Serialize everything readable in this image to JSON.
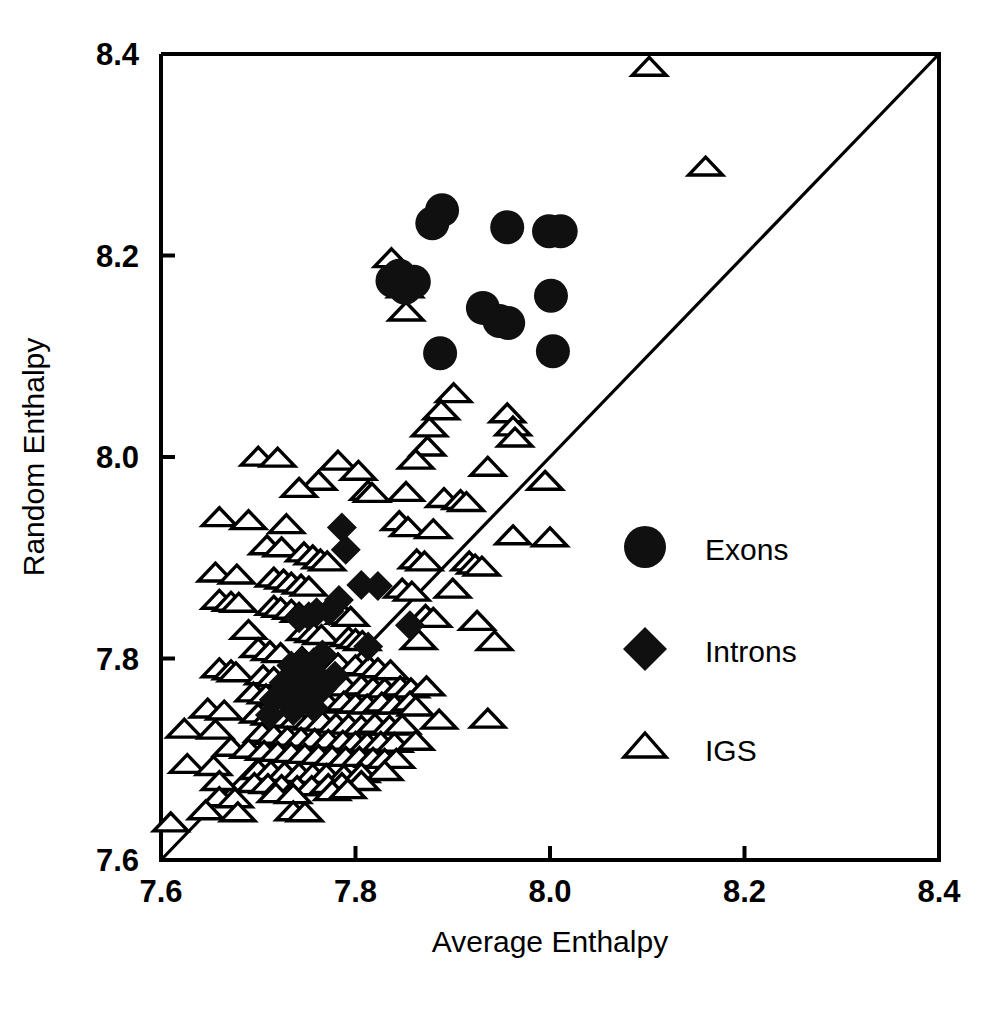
{
  "chart_data": {
    "type": "scatter",
    "title": "",
    "xlabel": "Average Enthalpy",
    "ylabel": "Random Enthalpy",
    "xlim": [
      7.6,
      8.4
    ],
    "ylim": [
      7.6,
      8.4
    ],
    "xticks": [
      "7.6",
      "7.8",
      "8.0",
      "8.2",
      "8.4"
    ],
    "yticks": [
      "7.6",
      "7.8",
      "8.0",
      "8.2",
      "8.4"
    ],
    "xtick_values": [
      7.6,
      7.8,
      8.0,
      8.2,
      8.4
    ],
    "ytick_values": [
      7.6,
      7.8,
      8.0,
      8.2,
      8.4
    ],
    "grid": false,
    "legend_position": "inside-lower-right",
    "reference_line": {
      "name": "identity-line",
      "description": "y = x diagonal",
      "from": [
        7.6,
        7.6
      ],
      "to": [
        8.4,
        8.4
      ]
    },
    "series": [
      {
        "name": "Exons",
        "marker": "filled-circle",
        "color": "#101010",
        "points": [
          [
            7.889,
            8.245
          ],
          [
            7.879,
            8.232
          ],
          [
            7.956,
            8.228
          ],
          [
            7.999,
            8.224
          ],
          [
            8.011,
            8.224
          ],
          [
            7.845,
            8.18
          ],
          [
            7.838,
            8.175
          ],
          [
            7.86,
            8.174
          ],
          [
            7.851,
            8.168
          ],
          [
            8.001,
            8.16
          ],
          [
            7.931,
            8.148
          ],
          [
            7.948,
            8.135
          ],
          [
            7.957,
            8.133
          ],
          [
            7.887,
            8.103
          ],
          [
            8.003,
            8.105
          ]
        ]
      },
      {
        "name": "Introns",
        "marker": "filled-diamond",
        "color": "#101010",
        "points": [
          [
            7.786,
            7.93
          ],
          [
            7.79,
            7.908
          ],
          [
            7.806,
            7.873
          ],
          [
            7.823,
            7.872
          ],
          [
            7.783,
            7.858
          ],
          [
            7.773,
            7.847
          ],
          [
            7.76,
            7.846
          ],
          [
            7.752,
            7.842
          ],
          [
            7.742,
            7.84
          ],
          [
            7.856,
            7.833
          ],
          [
            7.813,
            7.812
          ],
          [
            7.766,
            7.804
          ],
          [
            7.744,
            7.797
          ],
          [
            7.734,
            7.793
          ],
          [
            7.757,
            7.786
          ],
          [
            7.779,
            7.783
          ],
          [
            7.75,
            7.78
          ],
          [
            7.738,
            7.777
          ],
          [
            7.726,
            7.776
          ],
          [
            7.766,
            7.77
          ],
          [
            7.745,
            7.766
          ],
          [
            7.727,
            7.762
          ],
          [
            7.716,
            7.759
          ],
          [
            7.757,
            7.751
          ],
          [
            7.736,
            7.748
          ],
          [
            7.712,
            7.744
          ]
        ]
      },
      {
        "name": "IGS",
        "marker": "open-triangle",
        "color": "#ffffff",
        "points": [
          [
            8.102,
            8.387
          ],
          [
            8.16,
            8.288
          ],
          [
            7.837,
            8.197
          ],
          [
            7.851,
            8.167
          ],
          [
            7.852,
            8.144
          ],
          [
            7.901,
            8.063
          ],
          [
            7.888,
            8.046
          ],
          [
            7.956,
            8.043
          ],
          [
            7.962,
            8.03
          ],
          [
            7.876,
            8.029
          ],
          [
            7.964,
            8.019
          ],
          [
            7.874,
            8.01
          ],
          [
            7.7,
            8.0
          ],
          [
            7.72,
            7.999
          ],
          [
            7.782,
            7.996
          ],
          [
            7.862,
            7.997
          ],
          [
            7.936,
            7.99
          ],
          [
            7.803,
            7.986
          ],
          [
            7.995,
            7.976
          ],
          [
            7.762,
            7.976
          ],
          [
            7.742,
            7.969
          ],
          [
            7.813,
            7.966
          ],
          [
            7.817,
            7.964
          ],
          [
            7.852,
            7.965
          ],
          [
            7.891,
            7.959
          ],
          [
            7.908,
            7.957
          ],
          [
            7.914,
            7.955
          ],
          [
            7.66,
            7.94
          ],
          [
            7.69,
            7.937
          ],
          [
            7.845,
            7.936
          ],
          [
            7.729,
            7.933
          ],
          [
            7.854,
            7.93
          ],
          [
            7.88,
            7.928
          ],
          [
            7.962,
            7.922
          ],
          [
            8.0,
            7.92
          ],
          [
            7.709,
            7.912
          ],
          [
            7.724,
            7.91
          ],
          [
            7.747,
            7.905
          ],
          [
            7.756,
            7.902
          ],
          [
            7.764,
            7.898
          ],
          [
            7.771,
            7.896
          ],
          [
            7.863,
            7.898
          ],
          [
            7.871,
            7.896
          ],
          [
            7.917,
            7.896
          ],
          [
            7.923,
            7.893
          ],
          [
            7.93,
            7.891
          ],
          [
            7.656,
            7.885
          ],
          [
            7.678,
            7.883
          ],
          [
            7.716,
            7.88
          ],
          [
            7.726,
            7.878
          ],
          [
            7.734,
            7.875
          ],
          [
            7.744,
            7.873
          ],
          [
            7.752,
            7.871
          ],
          [
            7.848,
            7.869
          ],
          [
            7.858,
            7.866
          ],
          [
            7.9,
            7.869
          ],
          [
            7.66,
            7.858
          ],
          [
            7.672,
            7.856
          ],
          [
            7.68,
            7.855
          ],
          [
            7.716,
            7.852
          ],
          [
            7.723,
            7.85
          ],
          [
            7.734,
            7.848
          ],
          [
            7.742,
            7.845
          ],
          [
            7.788,
            7.843
          ],
          [
            7.795,
            7.841
          ],
          [
            7.872,
            7.843
          ],
          [
            7.88,
            7.84
          ],
          [
            7.925,
            7.837
          ],
          [
            7.69,
            7.828
          ],
          [
            7.748,
            7.827
          ],
          [
            7.757,
            7.825
          ],
          [
            7.765,
            7.823
          ],
          [
            7.793,
            7.821
          ],
          [
            7.8,
            7.819
          ],
          [
            7.807,
            7.817
          ],
          [
            7.865,
            7.818
          ],
          [
            7.943,
            7.817
          ],
          [
            7.7,
            7.81
          ],
          [
            7.712,
            7.807
          ],
          [
            7.723,
            7.805
          ],
          [
            7.745,
            7.801
          ],
          [
            7.757,
            7.799
          ],
          [
            7.771,
            7.797
          ],
          [
            7.782,
            7.795
          ],
          [
            7.8,
            7.793
          ],
          [
            7.814,
            7.792
          ],
          [
            7.823,
            7.79
          ],
          [
            7.836,
            7.788
          ],
          [
            7.66,
            7.79
          ],
          [
            7.672,
            7.788
          ],
          [
            7.677,
            7.786
          ],
          [
            7.705,
            7.783
          ],
          [
            7.716,
            7.781
          ],
          [
            7.731,
            7.779
          ],
          [
            7.745,
            7.777
          ],
          [
            7.76,
            7.775
          ],
          [
            7.776,
            7.774
          ],
          [
            7.79,
            7.772
          ],
          [
            7.806,
            7.773
          ],
          [
            7.818,
            7.771
          ],
          [
            7.83,
            7.77
          ],
          [
            7.846,
            7.772
          ],
          [
            7.857,
            7.77
          ],
          [
            7.873,
            7.772
          ],
          [
            7.695,
            7.766
          ],
          [
            7.708,
            7.764
          ],
          [
            7.722,
            7.762
          ],
          [
            7.735,
            7.76
          ],
          [
            7.748,
            7.759
          ],
          [
            7.76,
            7.757
          ],
          [
            7.772,
            7.755
          ],
          [
            7.788,
            7.757
          ],
          [
            7.8,
            7.755
          ],
          [
            7.812,
            7.754
          ],
          [
            7.827,
            7.756
          ],
          [
            7.84,
            7.754
          ],
          [
            7.856,
            7.757
          ],
          [
            7.862,
            7.752
          ],
          [
            7.648,
            7.75
          ],
          [
            7.665,
            7.748
          ],
          [
            7.7,
            7.745
          ],
          [
            7.712,
            7.743
          ],
          [
            7.726,
            7.741
          ],
          [
            7.74,
            7.74
          ],
          [
            7.754,
            7.738
          ],
          [
            7.766,
            7.737
          ],
          [
            7.78,
            7.735
          ],
          [
            7.793,
            7.734
          ],
          [
            7.806,
            7.733
          ],
          [
            7.82,
            7.735
          ],
          [
            7.835,
            7.733
          ],
          [
            7.848,
            7.734
          ],
          [
            7.886,
            7.739
          ],
          [
            7.624,
            7.73
          ],
          [
            7.656,
            7.729
          ],
          [
            7.704,
            7.726
          ],
          [
            7.716,
            7.724
          ],
          [
            7.73,
            7.722
          ],
          [
            7.744,
            7.721
          ],
          [
            7.758,
            7.72
          ],
          [
            7.772,
            7.719
          ],
          [
            7.787,
            7.718
          ],
          [
            7.8,
            7.717
          ],
          [
            7.812,
            7.716
          ],
          [
            7.826,
            7.717
          ],
          [
            7.84,
            7.716
          ],
          [
            7.862,
            7.718
          ],
          [
            7.936,
            7.74
          ],
          [
            7.672,
            7.712
          ],
          [
            7.69,
            7.71
          ],
          [
            7.706,
            7.708
          ],
          [
            7.72,
            7.707
          ],
          [
            7.734,
            7.706
          ],
          [
            7.748,
            7.705
          ],
          [
            7.762,
            7.704
          ],
          [
            7.776,
            7.703
          ],
          [
            7.79,
            7.702
          ],
          [
            7.804,
            7.702
          ],
          [
            7.818,
            7.701
          ],
          [
            7.83,
            7.7
          ],
          [
            7.842,
            7.7
          ],
          [
            7.627,
            7.695
          ],
          [
            7.654,
            7.693
          ],
          [
            7.7,
            7.689
          ],
          [
            7.713,
            7.688
          ],
          [
            7.727,
            7.687
          ],
          [
            7.742,
            7.686
          ],
          [
            7.756,
            7.685
          ],
          [
            7.77,
            7.685
          ],
          [
            7.788,
            7.684
          ],
          [
            7.806,
            7.686
          ],
          [
            7.83,
            7.688
          ],
          [
            7.66,
            7.678
          ],
          [
            7.696,
            7.676
          ],
          [
            7.71,
            7.675
          ],
          [
            7.724,
            7.674
          ],
          [
            7.74,
            7.673
          ],
          [
            7.755,
            7.673
          ],
          [
            7.772,
            7.675
          ],
          [
            7.786,
            7.676
          ],
          [
            7.806,
            7.678
          ],
          [
            7.66,
            7.662
          ],
          [
            7.676,
            7.661
          ],
          [
            7.718,
            7.666
          ],
          [
            7.736,
            7.665
          ],
          [
            7.776,
            7.668
          ],
          [
            7.792,
            7.67
          ],
          [
            7.646,
            7.649
          ],
          [
            7.679,
            7.647
          ],
          [
            7.736,
            7.648
          ],
          [
            7.748,
            7.647
          ],
          [
            7.61,
            7.637
          ]
        ]
      }
    ]
  },
  "legend": {
    "items": [
      {
        "label": "Exons",
        "marker": "filled-circle"
      },
      {
        "label": "Introns",
        "marker": "filled-diamond"
      },
      {
        "label": "IGS",
        "marker": "open-triangle"
      }
    ]
  },
  "axes": {
    "x_title": "Average Enthalpy",
    "y_title": "Random Enthalpy"
  }
}
